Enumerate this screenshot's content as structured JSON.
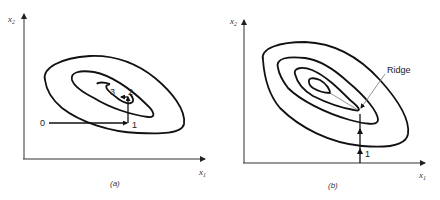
{
  "panels": [
    {
      "id": "a",
      "caption": "(a)",
      "x_axis_label": "x",
      "x_axis_sub": "1",
      "y_axis_label": "x",
      "y_axis_sub": "2",
      "contour_count": 3,
      "step_labels": [
        "0",
        "1",
        "2",
        "3"
      ],
      "description": "Coordinate search path: step along x1 from point 0 to 1, then up x2 to 2, then back along x1 to 3"
    },
    {
      "id": "b",
      "caption": "(b)",
      "x_axis_label": "x",
      "x_axis_sub": "1",
      "y_axis_label": "x",
      "y_axis_sub": "2",
      "contour_count": 4,
      "step_labels": [
        "1"
      ],
      "annotation": "Ridge",
      "description": "Search along x2 stalls at a ridge in elongated contours"
    }
  ]
}
